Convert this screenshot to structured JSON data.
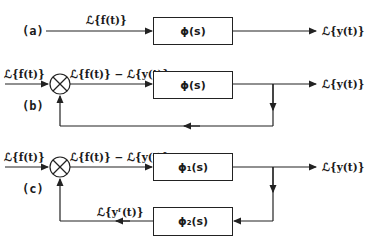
{
  "diagram": {
    "a": {
      "part_label": "(a)",
      "input_label": "ℒ{f(t)}",
      "block_label": "ϕ(s)",
      "output_label": "ℒ{y(t)}"
    },
    "b": {
      "part_label": "(b)",
      "input_label": "ℒ{f(t)}",
      "error_label": "ℒ{f(t)} − ℒ{y(t)}",
      "block_label": "ϕ(s)",
      "output_label": "ℒ{y(t)}"
    },
    "c": {
      "part_label": "(c)",
      "input_label": "ℒ{f(t)}",
      "error_label": "ℒ{f(t)} − ℒ{y(t)}",
      "forward_block_label": "ϕ₁(s)",
      "feedback_block_label": "ϕ₂(s)",
      "feedback_signal_label": "ℒ{yᶠ(t)}",
      "output_label": "ℒ{y(t)}"
    },
    "colors": {
      "line": "#222222",
      "background": "#ffffff"
    }
  }
}
